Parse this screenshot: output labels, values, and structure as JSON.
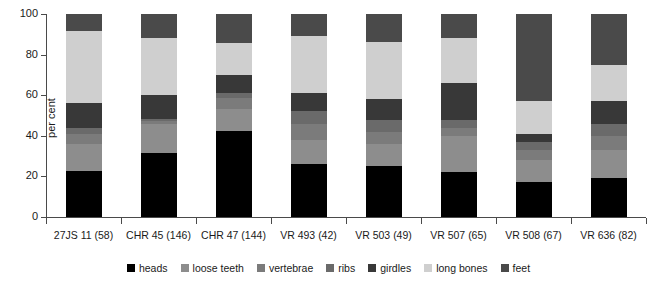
{
  "chart_data": {
    "type": "bar",
    "subtype": "stacked-bar-100",
    "title": "",
    "xlabel": "",
    "ylabel": "per cent",
    "ylim": [
      0,
      100
    ],
    "yticks": [
      0,
      20,
      40,
      60,
      80,
      100
    ],
    "grid": false,
    "legend_position": "bottom",
    "categories": [
      "27JS 11 (58)",
      "CHR 45 (146)",
      "CHR 47 (144)",
      "VR 493 (42)",
      "VR 503 (49)",
      "VR 507 (65)",
      "VR 508 (67)",
      "VR 636 (82)"
    ],
    "series": [
      {
        "name": "heads",
        "color": "#000000",
        "values": [
          22.5,
          31.5,
          42.5,
          26.0,
          25.0,
          22.0,
          17.0,
          19.0
        ]
      },
      {
        "name": "loose teeth",
        "color": "#8d8d8d",
        "values": [
          13.5,
          14.5,
          10.5,
          12.0,
          11.0,
          18.0,
          11.0,
          14.0
        ]
      },
      {
        "name": "vertebrae",
        "color": "#7b7b7b",
        "values": [
          5.0,
          1.5,
          5.5,
          8.0,
          6.0,
          4.0,
          5.0,
          7.0
        ]
      },
      {
        "name": "ribs",
        "color": "#6a6a6a",
        "values": [
          3.0,
          1.0,
          2.5,
          6.0,
          6.0,
          4.0,
          4.0,
          6.0
        ]
      },
      {
        "name": "girdles",
        "color": "#383838",
        "values": [
          12.0,
          11.5,
          9.0,
          9.0,
          10.0,
          18.0,
          4.0,
          11.0
        ]
      },
      {
        "name": "long bones",
        "color": "#cfcfcf",
        "values": [
          35.5,
          28.0,
          15.5,
          28.0,
          28.0,
          22.0,
          16.0,
          18.0
        ]
      },
      {
        "name": "feet",
        "color": "#4a4a4a",
        "values": [
          8.5,
          12.0,
          14.5,
          11.0,
          14.0,
          12.0,
          43.0,
          25.0
        ]
      }
    ]
  },
  "legend": {
    "items": [
      {
        "label": "heads",
        "color": "#000000"
      },
      {
        "label": "loose teeth",
        "color": "#8d8d8d"
      },
      {
        "label": "vertebrae",
        "color": "#7b7b7b"
      },
      {
        "label": "ribs",
        "color": "#6a6a6a"
      },
      {
        "label": "girdles",
        "color": "#383838"
      },
      {
        "label": "long bones",
        "color": "#cfcfcf"
      },
      {
        "label": "feet",
        "color": "#4a4a4a"
      }
    ]
  }
}
